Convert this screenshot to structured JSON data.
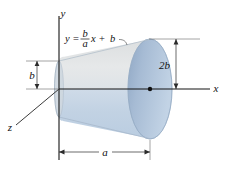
{
  "figure": {
    "axes": {
      "x_label": "x",
      "y_label": "y",
      "z_label": "z"
    },
    "equation": {
      "lhs": "y",
      "equals": "=",
      "numerator": "b",
      "denominator": "a",
      "x_term": "x",
      "plus": "+",
      "constant": "b",
      "full_text": "y = (b/a)x + b"
    },
    "dimensions": [
      {
        "name": "left-radius",
        "label": "b"
      },
      {
        "name": "right-radius",
        "label": "2b"
      },
      {
        "name": "length",
        "label": "a"
      }
    ],
    "colors": {
      "body_upper": "#e2e5e6",
      "body_lower": "#c2d2e3",
      "face_ellipse": "#9db4cf",
      "face_ellipse_light": "#b9cade",
      "axis_line": "#1a1a1a",
      "dimension_line": "#3a3a3a",
      "outline": "#8fa3ba",
      "background": "#ffffff"
    }
  }
}
